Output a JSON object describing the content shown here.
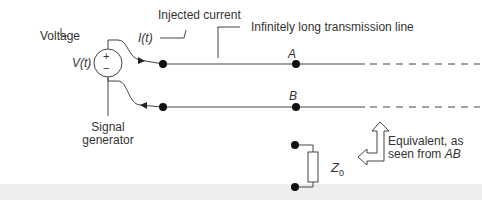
{
  "diagram": {
    "labels": {
      "voltage": "Voltage",
      "voltage_symbol": "V(t)",
      "injected_current": "Injected current",
      "current_symbol": "I(t)",
      "line_label": "Infinitely long transmission line",
      "node_a": "A",
      "node_b": "B",
      "generator_line1": "Signal",
      "generator_line2": "generator",
      "equivalent_line1": "Equivalent, as",
      "equivalent_line2_prefix": "seen from ",
      "equivalent_line2_italic": "AB",
      "impedance": "Z",
      "impedance_sub": "0",
      "plus": "+",
      "minus": "−"
    },
    "colors": {
      "line": "#444444",
      "dot": "#111111",
      "text": "#333333",
      "band": "#eeeeee"
    }
  }
}
